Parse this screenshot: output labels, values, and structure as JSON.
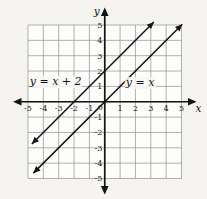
{
  "figure": {
    "background": "#f5f4f1",
    "plot_background": "#fdfdfb",
    "grid_color": "#8f8f8f",
    "axis_color": "#141414",
    "line_color": "#141414",
    "text_color": "#141414"
  },
  "chart_data": {
    "type": "line",
    "title": "",
    "xlabel": "x",
    "ylabel": "y",
    "xlim": [
      -5,
      5
    ],
    "ylim": [
      -5,
      5
    ],
    "grid": true,
    "x_ticks": [
      -5,
      -4,
      -3,
      -2,
      -1,
      1,
      2,
      3,
      4,
      5
    ],
    "y_ticks": [
      -5,
      -4,
      -3,
      -2,
      -1,
      1,
      2,
      3,
      4,
      5
    ],
    "origin_label": "0",
    "series": [
      {
        "name": "y = x + 2",
        "slope": 1,
        "intercept": 2,
        "x_range": [
          -4.75,
          3.2
        ],
        "label_pos": [
          -3.2,
          1.3
        ]
      },
      {
        "name": "y = x",
        "slope": 1,
        "intercept": 0,
        "x_range": [
          -4.65,
          5.05
        ],
        "label_pos": [
          2.3,
          1.2
        ]
      }
    ]
  }
}
